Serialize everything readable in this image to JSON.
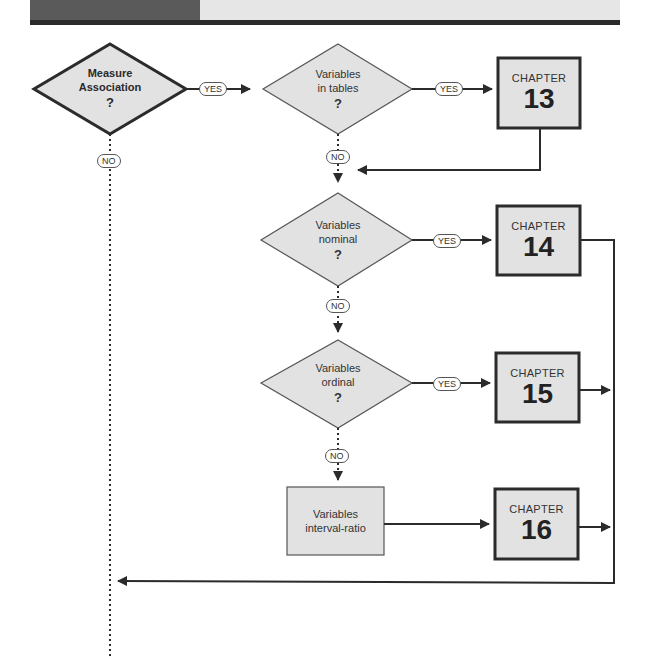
{
  "colors": {
    "box_fill": "#e2e2e2",
    "stroke": "#2b2b2b",
    "header_dark": "#5a5a5a",
    "header_light": "#e6e6e6"
  },
  "decisions": [
    {
      "id": "measure-association",
      "line1": "Measure",
      "line2": "Association",
      "q": "?"
    },
    {
      "id": "variables-in-tables",
      "line1": "Variables",
      "line2": "in tables",
      "q": "?"
    },
    {
      "id": "variables-nominal",
      "line1": "Variables",
      "line2": "nominal",
      "q": "?"
    },
    {
      "id": "variables-ordinal",
      "line1": "Variables",
      "line2": "ordinal",
      "q": "?"
    }
  ],
  "process": {
    "line1": "Variables",
    "line2": "interval-ratio"
  },
  "chapters": [
    {
      "word": "CHAPTER",
      "number": "13"
    },
    {
      "word": "CHAPTER",
      "number": "14"
    },
    {
      "word": "CHAPTER",
      "number": "15"
    },
    {
      "word": "CHAPTER",
      "number": "16"
    }
  ],
  "labels": {
    "yes": "YES",
    "no": "NO"
  }
}
